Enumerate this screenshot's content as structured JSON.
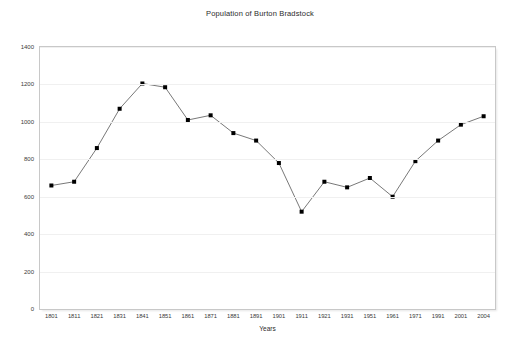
{
  "chart_data": {
    "type": "line",
    "title": "Population of Burton Bradstock",
    "xlabel": "Years",
    "ylabel": "Numbers",
    "categories": [
      "1801",
      "1811",
      "1821",
      "1831",
      "1841",
      "1851",
      "1861",
      "1871",
      "1881",
      "1891",
      "1901",
      "1911",
      "1921",
      "1931",
      "1951",
      "1961",
      "1971",
      "1991",
      "2001",
      "2004"
    ],
    "values": [
      660,
      680,
      860,
      1070,
      1205,
      1185,
      1010,
      1035,
      940,
      900,
      780,
      520,
      680,
      650,
      700,
      600,
      790,
      900,
      985,
      1030
    ],
    "series": [
      {
        "name": "Population",
        "values": [
          660,
          680,
          860,
          1070,
          1205,
          1185,
          1010,
          1035,
          940,
          900,
          780,
          520,
          680,
          650,
          700,
          600,
          790,
          900,
          985,
          1030
        ]
      }
    ],
    "ylim": [
      0,
      1400
    ],
    "yticks": [
      0,
      200,
      400,
      600,
      800,
      1000,
      1200,
      1400
    ],
    "ytick_labels": [
      "0",
      "200",
      "400",
      "600",
      "800",
      "1000",
      "1200",
      "1400"
    ],
    "grid": "horizontal",
    "legend": "none",
    "marker": "square",
    "marker_color": "#000000",
    "line_color": "#555555",
    "background": "#ffffff",
    "frame_color": "#c8c8c8"
  }
}
